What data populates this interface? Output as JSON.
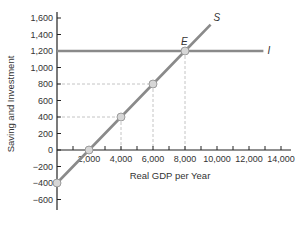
{
  "chart_data": {
    "type": "line",
    "title": "",
    "xlabel": "Real GDP per Year",
    "ylabel": "Saving and Investment",
    "xlim": [
      0,
      14500
    ],
    "ylim": [
      -700,
      1700
    ],
    "x_ticks": [
      2000,
      4000,
      6000,
      8000,
      10000,
      12000,
      14000
    ],
    "x_tick_labels": [
      "2,000",
      "4,000",
      "6,000",
      "8,000",
      "10,000",
      "12,000",
      "14,000"
    ],
    "x_minor_ticks": [
      1000,
      3000,
      5000,
      7000,
      9000,
      11000,
      13000
    ],
    "y_ticks": [
      -600,
      -400,
      -200,
      0,
      200,
      400,
      600,
      800,
      1000,
      1200,
      1400,
      1600
    ],
    "y_tick_labels": [
      "−600",
      "−400",
      "−200",
      "0",
      "200",
      "400",
      "600",
      "800",
      "1,000",
      "1,200",
      "1,400",
      "1,600"
    ],
    "grid": false,
    "series": [
      {
        "name": "S",
        "label": "S",
        "points": [
          [
            0,
            -400
          ],
          [
            2000,
            0
          ],
          [
            4000,
            400
          ],
          [
            6000,
            800
          ],
          [
            8000,
            1200
          ],
          [
            9600,
            1520
          ]
        ],
        "markers": [
          [
            0,
            -400
          ],
          [
            2000,
            0
          ],
          [
            4000,
            400
          ],
          [
            6000,
            800
          ],
          [
            8000,
            1200
          ]
        ]
      },
      {
        "name": "I",
        "label": "I",
        "points": [
          [
            0,
            1200
          ],
          [
            12900,
            1200
          ]
        ]
      }
    ],
    "guides": [
      {
        "from": [
          0,
          400
        ],
        "to": [
          4000,
          400
        ]
      },
      {
        "from": [
          4000,
          400
        ],
        "to": [
          4000,
          0
        ]
      },
      {
        "from": [
          0,
          800
        ],
        "to": [
          6000,
          800
        ]
      },
      {
        "from": [
          6000,
          800
        ],
        "to": [
          6000,
          0
        ]
      },
      {
        "from": [
          8000,
          1200
        ],
        "to": [
          8000,
          0
        ]
      }
    ],
    "annotations": [
      {
        "text": "E",
        "at": [
          8000,
          1200
        ],
        "meaning": "equilibrium"
      }
    ],
    "colors": {
      "line": "#8a8a8a",
      "marker_fill": "#d6d6d6",
      "marker_stroke": "#8a8a8a",
      "axis": "#222222",
      "guide": "#b5b5b5"
    }
  }
}
